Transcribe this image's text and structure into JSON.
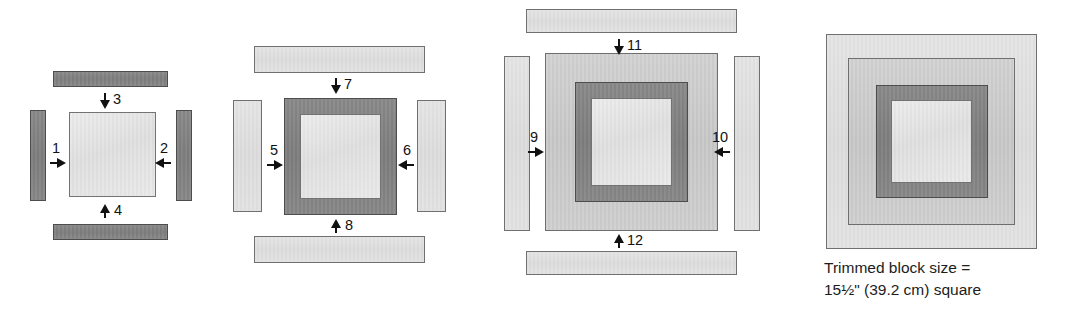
{
  "figure": {
    "type": "quilt-block-assembly-diagram",
    "panel_count": 4
  },
  "caption": {
    "line1": "Trimmed block size =",
    "line2": "15½\" (39.2 cm) square"
  },
  "colors": {
    "dark_fabric": "#818181",
    "medium_fabric": "#cccccc",
    "light_fabric": "#e0e0e0",
    "pale_center": "#e6e6e6",
    "outline": "#6f6f6f",
    "text": "#1a1a1a"
  },
  "panels": [
    {
      "id": "panel-1",
      "name": "step-1-center-with-round-1",
      "center_patch": "pale center square",
      "strips": [
        {
          "label": "1",
          "position": "left",
          "arrow": "right",
          "fabric": "dark"
        },
        {
          "label": "2",
          "position": "right",
          "arrow": "left",
          "fabric": "dark"
        },
        {
          "label": "3",
          "position": "top",
          "arrow": "down",
          "fabric": "dark"
        },
        {
          "label": "4",
          "position": "bottom",
          "arrow": "up",
          "fabric": "dark"
        }
      ]
    },
    {
      "id": "panel-2",
      "name": "step-2-round-2",
      "center_patch": "center square framed by round 1 dark strips",
      "strips": [
        {
          "label": "5",
          "position": "left",
          "arrow": "right",
          "fabric": "light"
        },
        {
          "label": "6",
          "position": "right",
          "arrow": "left",
          "fabric": "light"
        },
        {
          "label": "7",
          "position": "top",
          "arrow": "down",
          "fabric": "light"
        },
        {
          "label": "8",
          "position": "bottom",
          "arrow": "up",
          "fabric": "light"
        }
      ]
    },
    {
      "id": "panel-3",
      "name": "step-3-round-3",
      "center_patch": "center square framed by rounds 1 and 2",
      "strips": [
        {
          "label": "9",
          "position": "left",
          "arrow": "right",
          "fabric": "light"
        },
        {
          "label": "10",
          "position": "right",
          "arrow": "left",
          "fabric": "light"
        },
        {
          "label": "11",
          "position": "top",
          "arrow": "down",
          "fabric": "light"
        },
        {
          "label": "12",
          "position": "bottom",
          "arrow": "up",
          "fabric": "light"
        }
      ]
    },
    {
      "id": "panel-4",
      "name": "step-4-completed-block",
      "center_patch": "completed block with three rounds of strips",
      "strips": []
    }
  ],
  "labels": {
    "n1": "1",
    "n2": "2",
    "n3": "3",
    "n4": "4",
    "n5": "5",
    "n6": "6",
    "n7": "7",
    "n8": "8",
    "n9": "9",
    "n10": "10",
    "n11": "11",
    "n12": "12"
  }
}
